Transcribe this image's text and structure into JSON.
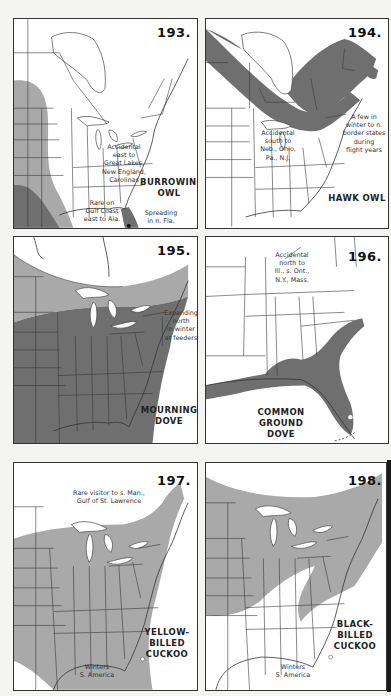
{
  "page": {
    "legend_colors": {
      "range": "#6f6f6f",
      "secondary_range": "#a9a9a9",
      "background": "#ffffff"
    }
  },
  "maps": [
    {
      "number": "193.",
      "species": "BURROWING OWL",
      "species_lines": [
        "BURROWING",
        "OWL"
      ],
      "notes": [
        {
          "id": "accidental",
          "lines": [
            "Accidental",
            "east to",
            "Great Lakes,",
            "New England,",
            "Carolinas"
          ]
        },
        {
          "id": "gulf",
          "lines": [
            "Rare on",
            "Gulf Coast",
            "east to Ala."
          ]
        },
        {
          "id": "spreading",
          "lines": [
            "Spreading",
            "in n. Fla."
          ]
        }
      ]
    },
    {
      "number": "194.",
      "species": "HAWK OWL",
      "species_lines": [
        "HAWK OWL"
      ],
      "notes": [
        {
          "id": "accidental",
          "lines": [
            "Accidental",
            "south to",
            "Neb., Ohio,",
            "Pa., N.J."
          ]
        },
        {
          "id": "winter",
          "lines": [
            "A few in",
            "winter to n.",
            "border states",
            "during",
            "flight years"
          ]
        }
      ]
    },
    {
      "number": "195.",
      "species": "MOURNING DOVE",
      "species_lines": [
        "MOURNING",
        "DOVE"
      ],
      "notes": [
        {
          "id": "expanding",
          "lines": [
            "Expanding",
            "north",
            "in winter",
            "at feeders"
          ]
        }
      ]
    },
    {
      "number": "196.",
      "species": "COMMON GROUND DOVE",
      "species_lines": [
        "COMMON",
        "GROUND",
        "DOVE"
      ],
      "notes": [
        {
          "id": "accidental",
          "lines": [
            "Accidental",
            "north to",
            "Ill., s. Ont.,",
            "N.Y., Mass."
          ]
        }
      ]
    },
    {
      "number": "197.",
      "species": "YELLOW-BILLED CUCKOO",
      "species_lines": [
        "YELLOW-",
        "BILLED",
        "CUCKOO"
      ],
      "notes": [
        {
          "id": "rare",
          "lines": [
            "Rare visitor to s. Man.,",
            "Gulf of St. Lawrence"
          ]
        },
        {
          "id": "winters",
          "lines": [
            "Winters",
            "S. America"
          ]
        }
      ]
    },
    {
      "number": "198.",
      "species": "BLACK-BILLED CUCKOO",
      "species_lines": [
        "BLACK-",
        "BILLED",
        "CUCKOO"
      ],
      "notes": [
        {
          "id": "winters",
          "lines": [
            "Winters",
            "S. America"
          ]
        }
      ]
    }
  ]
}
